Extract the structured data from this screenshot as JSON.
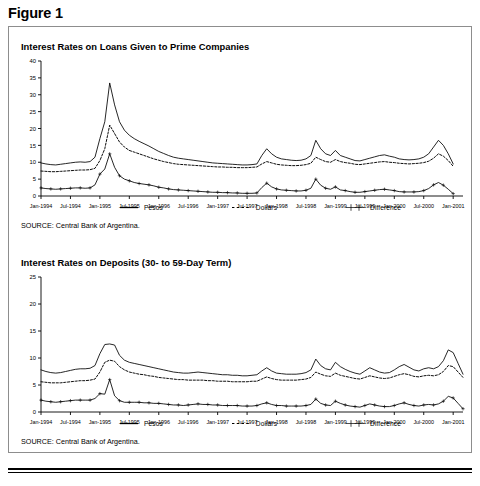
{
  "figure": {
    "label": "Figure 1"
  },
  "panels": [
    {
      "title": "Interest Rates on Loans Given to Prime Companies",
      "source": "SOURCE: Central Bank of Argentina.",
      "legend": [
        {
          "label": "Pesos",
          "key": "solid-line"
        },
        {
          "label": "Dollars",
          "key": "dotted-line"
        },
        {
          "label": "Difference",
          "key": "plus-marker-line"
        }
      ]
    },
    {
      "title": "Interest Rates on Deposits (30- to 59-Day Term)",
      "source": "SOURCE: Central Bank of Argentina.",
      "legend": [
        {
          "label": "Pesos",
          "key": "solid-line"
        },
        {
          "label": "Dollars",
          "key": "dotted-line"
        },
        {
          "label": "Difference",
          "key": "plus-marker-line"
        }
      ]
    }
  ],
  "chart_data": [
    {
      "type": "line",
      "title": "Interest Rates on Loans Given to Prime Companies",
      "xlabel": "",
      "ylabel": "",
      "ylim": [
        0,
        40
      ],
      "yticks": [
        0,
        5,
        10,
        15,
        20,
        25,
        30,
        35,
        40
      ],
      "ytick_labels": [
        "0",
        "5",
        "10",
        "15",
        "20",
        "25",
        "30",
        "35",
        "40"
      ],
      "grid": false,
      "legend_position": "below-axis",
      "xtick_labels": [
        "Jan-1994",
        "Jul-1994",
        "Jan-1995",
        "Jul-1995",
        "Jan-1996",
        "Jul-1996",
        "Jan-1997",
        "Jul-1997",
        "Jan-1998",
        "Jul-1998",
        "Jan-1999",
        "Jul-1999",
        "Jan-2000",
        "Jul-2000",
        "Jan-2001"
      ],
      "x": [
        "Jan-1994",
        "Feb-1994",
        "Mar-1994",
        "Apr-1994",
        "May-1994",
        "Jun-1994",
        "Jul-1994",
        "Aug-1994",
        "Sep-1994",
        "Oct-1994",
        "Nov-1994",
        "Dec-1994",
        "Jan-1995",
        "Feb-1995",
        "Mar-1995",
        "Apr-1995",
        "May-1995",
        "Jun-1995",
        "Jul-1995",
        "Aug-1995",
        "Sep-1995",
        "Oct-1995",
        "Nov-1995",
        "Dec-1995",
        "Jan-1996",
        "Feb-1996",
        "Mar-1996",
        "Apr-1996",
        "May-1996",
        "Jun-1996",
        "Jul-1996",
        "Aug-1996",
        "Sep-1996",
        "Oct-1996",
        "Nov-1996",
        "Dec-1996",
        "Jan-1997",
        "Feb-1997",
        "Mar-1997",
        "Apr-1997",
        "May-1997",
        "Jun-1997",
        "Jul-1997",
        "Aug-1997",
        "Sep-1997",
        "Oct-1997",
        "Nov-1997",
        "Dec-1997",
        "Jan-1998",
        "Feb-1998",
        "Mar-1998",
        "Apr-1998",
        "May-1998",
        "Jun-1998",
        "Jul-1998",
        "Aug-1998",
        "Sep-1998",
        "Oct-1998",
        "Nov-1998",
        "Dec-1998",
        "Jan-1999",
        "Feb-1999",
        "Mar-1999",
        "Apr-1999",
        "May-1999",
        "Jun-1999",
        "Jul-1999",
        "Aug-1999",
        "Sep-1999",
        "Oct-1999",
        "Nov-1999",
        "Dec-1999",
        "Jan-2000",
        "Feb-2000",
        "Mar-2000",
        "Apr-2000",
        "May-2000",
        "Jun-2000",
        "Jul-2000",
        "Aug-2000",
        "Sep-2000",
        "Oct-2000",
        "Nov-2000",
        "Dec-2000",
        "Jan-2001",
        "Feb-2001",
        "Mar-2001"
      ],
      "series": [
        {
          "name": "Pesos",
          "style": "solid",
          "values": [
            9.8,
            9.5,
            9.3,
            9.2,
            9.4,
            9.6,
            9.8,
            10.0,
            10.1,
            10.0,
            10.2,
            11.5,
            17.0,
            22.0,
            33.5,
            27.0,
            22.0,
            19.5,
            18.0,
            17.0,
            16.2,
            15.5,
            14.8,
            14.0,
            13.2,
            12.6,
            12.0,
            11.5,
            11.2,
            11.0,
            10.8,
            10.6,
            10.4,
            10.2,
            10.0,
            9.8,
            9.7,
            9.6,
            9.5,
            9.4,
            9.3,
            9.2,
            9.2,
            9.3,
            9.5,
            12.0,
            14.0,
            12.5,
            11.5,
            11.0,
            10.8,
            10.6,
            10.5,
            10.6,
            11.0,
            12.0,
            16.5,
            14.0,
            12.5,
            12.0,
            13.5,
            12.0,
            11.5,
            11.0,
            10.5,
            10.4,
            10.8,
            11.2,
            11.6,
            12.0,
            12.2,
            11.8,
            11.5,
            11.0,
            10.8,
            10.7,
            10.8,
            11.0,
            11.5,
            12.5,
            14.5,
            16.5,
            15.0,
            12.5,
            9.5
          ]
        },
        {
          "name": "Dollars",
          "style": "dotted",
          "values": [
            7.4,
            7.3,
            7.2,
            7.2,
            7.3,
            7.4,
            7.5,
            7.6,
            7.7,
            7.7,
            7.8,
            8.2,
            10.5,
            14.0,
            21.0,
            18.5,
            16.0,
            14.5,
            13.5,
            13.0,
            12.5,
            12.0,
            11.5,
            11.0,
            10.6,
            10.2,
            9.9,
            9.6,
            9.4,
            9.3,
            9.2,
            9.1,
            9.0,
            8.9,
            8.8,
            8.7,
            8.6,
            8.6,
            8.5,
            8.5,
            8.4,
            8.4,
            8.4,
            8.5,
            8.6,
            9.5,
            10.2,
            9.8,
            9.4,
            9.2,
            9.1,
            9.0,
            9.0,
            9.1,
            9.3,
            9.7,
            11.5,
            10.8,
            10.2,
            10.0,
            10.8,
            10.2,
            9.9,
            9.7,
            9.4,
            9.3,
            9.5,
            9.7,
            9.9,
            10.1,
            10.2,
            10.0,
            9.9,
            9.7,
            9.6,
            9.5,
            9.6,
            9.7,
            9.9,
            10.3,
            11.2,
            12.5,
            11.8,
            10.5,
            8.8
          ]
        },
        {
          "name": "Difference",
          "style": "plus",
          "values": [
            2.4,
            2.2,
            2.1,
            2.0,
            2.1,
            2.2,
            2.3,
            2.4,
            2.4,
            2.3,
            2.4,
            3.3,
            6.5,
            8.0,
            12.5,
            8.5,
            6.0,
            5.0,
            4.5,
            4.0,
            3.7,
            3.5,
            3.3,
            3.0,
            2.6,
            2.4,
            2.1,
            1.9,
            1.8,
            1.7,
            1.6,
            1.5,
            1.4,
            1.3,
            1.2,
            1.1,
            1.1,
            1.0,
            1.0,
            0.9,
            0.9,
            0.8,
            0.8,
            0.8,
            0.9,
            2.5,
            3.8,
            2.7,
            2.1,
            1.8,
            1.7,
            1.6,
            1.5,
            1.5,
            1.7,
            2.3,
            5.0,
            3.2,
            2.3,
            2.0,
            2.7,
            1.8,
            1.6,
            1.3,
            1.1,
            1.1,
            1.3,
            1.5,
            1.7,
            1.9,
            2.0,
            1.8,
            1.6,
            1.3,
            1.2,
            1.2,
            1.2,
            1.3,
            1.6,
            2.2,
            3.3,
            4.0,
            3.2,
            2.0,
            0.7
          ]
        }
      ]
    },
    {
      "type": "line",
      "title": "Interest Rates on Deposits (30- to 59-Day Term)",
      "xlabel": "",
      "ylabel": "",
      "ylim": [
        0,
        25
      ],
      "yticks": [
        0,
        5,
        10,
        15,
        20,
        25
      ],
      "ytick_labels": [
        "0",
        "5",
        "10",
        "15",
        "20",
        "25"
      ],
      "grid": false,
      "legend_position": "below-axis",
      "xtick_labels": [
        "Jan-1994",
        "Jul-1994",
        "Jan-1995",
        "Jul-1995",
        "Jan-1996",
        "Jul-1996",
        "Jan-1997",
        "Jul-1997",
        "Jan-1998",
        "Jul-1998",
        "Jan-1999",
        "Jul-1999",
        "Jan-2000",
        "Jul-2000",
        "Jan-2001"
      ],
      "x": [
        "Jan-1994",
        "Feb-1994",
        "Mar-1994",
        "Apr-1994",
        "May-1994",
        "Jun-1994",
        "Jul-1994",
        "Aug-1994",
        "Sep-1994",
        "Oct-1994",
        "Nov-1994",
        "Dec-1994",
        "Jan-1995",
        "Feb-1995",
        "Mar-1995",
        "Apr-1995",
        "May-1995",
        "Jun-1995",
        "Jul-1995",
        "Aug-1995",
        "Sep-1995",
        "Oct-1995",
        "Nov-1995",
        "Dec-1995",
        "Jan-1996",
        "Feb-1996",
        "Mar-1996",
        "Apr-1996",
        "May-1996",
        "Jun-1996",
        "Jul-1996",
        "Aug-1996",
        "Sep-1996",
        "Oct-1996",
        "Nov-1996",
        "Dec-1996",
        "Jan-1997",
        "Feb-1997",
        "Mar-1997",
        "Apr-1997",
        "May-1997",
        "Jun-1997",
        "Jul-1997",
        "Aug-1997",
        "Sep-1997",
        "Oct-1997",
        "Nov-1997",
        "Dec-1997",
        "Jan-1998",
        "Feb-1998",
        "Mar-1998",
        "Apr-1998",
        "May-1998",
        "Jun-1998",
        "Jul-1998",
        "Aug-1998",
        "Sep-1998",
        "Oct-1998",
        "Nov-1998",
        "Dec-1998",
        "Jan-1999",
        "Feb-1999",
        "Mar-1999",
        "Apr-1999",
        "May-1999",
        "Jun-1999",
        "Jul-1999",
        "Aug-1999",
        "Sep-1999",
        "Oct-1999",
        "Nov-1999",
        "Dec-1999",
        "Jan-2000",
        "Feb-2000",
        "Mar-2000",
        "Apr-2000",
        "May-2000",
        "Jun-2000",
        "Jul-2000",
        "Aug-2000",
        "Sep-2000",
        "Oct-2000",
        "Nov-2000",
        "Dec-2000",
        "Jan-2001",
        "Feb-2001",
        "Mar-2001"
      ],
      "series": [
        {
          "name": "Pesos",
          "style": "solid",
          "values": [
            7.8,
            7.5,
            7.3,
            7.2,
            7.3,
            7.5,
            7.7,
            7.9,
            8.0,
            8.0,
            8.1,
            8.6,
            10.8,
            12.5,
            12.6,
            12.4,
            10.5,
            9.6,
            9.2,
            9.0,
            8.8,
            8.6,
            8.4,
            8.2,
            8.0,
            7.8,
            7.6,
            7.4,
            7.3,
            7.2,
            7.2,
            7.3,
            7.4,
            7.3,
            7.2,
            7.1,
            7.0,
            6.9,
            6.9,
            6.8,
            6.8,
            6.7,
            6.7,
            6.8,
            6.9,
            7.6,
            8.2,
            7.6,
            7.2,
            7.1,
            7.0,
            7.0,
            7.0,
            7.1,
            7.3,
            7.8,
            9.8,
            8.6,
            8.0,
            7.8,
            9.2,
            8.4,
            7.9,
            7.5,
            7.2,
            7.0,
            7.6,
            8.2,
            7.8,
            7.4,
            7.2,
            7.3,
            7.8,
            8.4,
            8.8,
            8.3,
            7.8,
            7.6,
            8.0,
            8.2,
            8.0,
            8.4,
            9.5,
            11.5,
            11.0,
            9.0,
            7.0
          ]
        },
        {
          "name": "Dollars",
          "style": "dotted",
          "values": [
            5.6,
            5.5,
            5.4,
            5.4,
            5.4,
            5.5,
            5.6,
            5.7,
            5.8,
            5.8,
            5.9,
            6.1,
            7.4,
            9.2,
            9.6,
            9.4,
            8.4,
            7.8,
            7.4,
            7.2,
            7.0,
            6.9,
            6.7,
            6.6,
            6.4,
            6.3,
            6.2,
            6.1,
            6.0,
            6.0,
            5.9,
            5.9,
            5.9,
            5.9,
            5.8,
            5.8,
            5.7,
            5.7,
            5.7,
            5.6,
            5.6,
            5.6,
            5.6,
            5.7,
            5.7,
            6.1,
            6.5,
            6.2,
            6.0,
            5.9,
            5.9,
            5.9,
            5.9,
            6.0,
            6.1,
            6.4,
            7.4,
            7.0,
            6.7,
            6.6,
            7.2,
            6.8,
            6.6,
            6.4,
            6.2,
            6.1,
            6.4,
            6.7,
            6.5,
            6.3,
            6.2,
            6.3,
            6.6,
            6.9,
            7.1,
            6.9,
            6.6,
            6.5,
            6.7,
            6.8,
            6.7,
            6.9,
            7.5,
            8.6,
            8.4,
            7.4,
            6.4
          ]
        },
        {
          "name": "Difference",
          "style": "plus",
          "values": [
            2.2,
            2.0,
            1.9,
            1.8,
            1.9,
            2.0,
            2.1,
            2.2,
            2.2,
            2.2,
            2.2,
            2.5,
            3.4,
            3.3,
            6.0,
            3.0,
            2.1,
            1.8,
            1.8,
            1.8,
            1.8,
            1.7,
            1.7,
            1.6,
            1.6,
            1.5,
            1.4,
            1.3,
            1.3,
            1.2,
            1.3,
            1.4,
            1.5,
            1.4,
            1.4,
            1.3,
            1.3,
            1.2,
            1.2,
            1.2,
            1.2,
            1.1,
            1.1,
            1.1,
            1.2,
            1.5,
            1.7,
            1.4,
            1.2,
            1.2,
            1.1,
            1.1,
            1.1,
            1.1,
            1.2,
            1.4,
            2.4,
            1.6,
            1.3,
            1.2,
            2.0,
            1.6,
            1.3,
            1.1,
            1.0,
            0.9,
            1.2,
            1.5,
            1.3,
            1.1,
            1.0,
            1.0,
            1.2,
            1.5,
            1.7,
            1.4,
            1.2,
            1.1,
            1.3,
            1.4,
            1.3,
            1.5,
            2.0,
            2.9,
            2.6,
            1.6,
            0.6
          ]
        }
      ]
    }
  ]
}
